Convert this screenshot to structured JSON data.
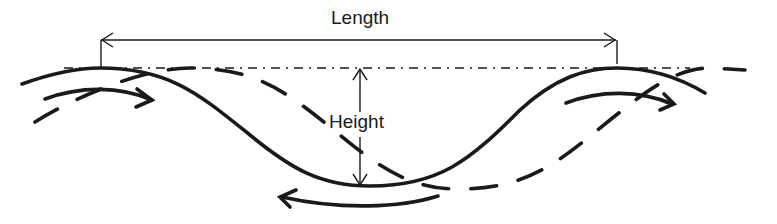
{
  "diagram": {
    "labels": {
      "length": "Length",
      "height": "Height"
    },
    "elements": {
      "solid_profile": "wave-profile",
      "dashed_profile": "shifted-wave-profile",
      "reference_line": "dash-dot-crest-line",
      "flow_arrows": [
        "flow-arrow-left-crest",
        "flow-arrow-trough",
        "flow-arrow-right-crest"
      ]
    },
    "colors": {
      "stroke": "#1a1a1a",
      "background": "#ffffff"
    }
  }
}
